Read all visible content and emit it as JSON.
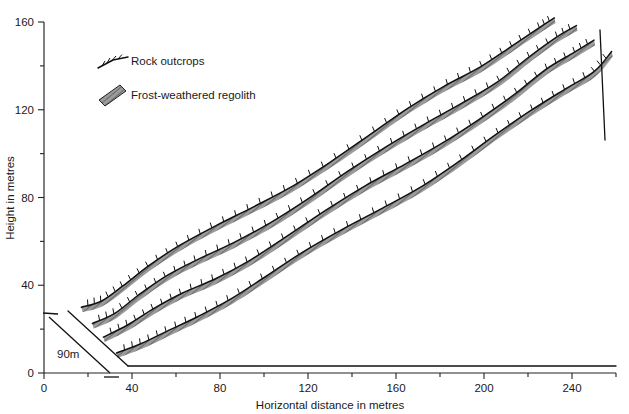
{
  "figure": {
    "type": "block-diagram"
  },
  "axes": {
    "x": {
      "title": "Horizontal distance in metres",
      "min": 0,
      "max": 260,
      "major_step": 40,
      "minor_step": 20,
      "labels": [
        "0",
        "40",
        "80",
        "120",
        "160",
        "200",
        "240"
      ],
      "label_values": [
        0,
        40,
        80,
        120,
        160,
        200,
        240
      ],
      "minor_values": [
        20,
        60,
        100,
        140,
        180,
        220,
        260
      ]
    },
    "y": {
      "title": "Height in metres",
      "min": 0,
      "max": 160,
      "major_step": 40,
      "minor_step": 20,
      "labels": [
        "0",
        "40",
        "80",
        "120",
        "160"
      ],
      "label_values": [
        0,
        40,
        80,
        120,
        160
      ],
      "minor_values": [
        20,
        60,
        100,
        140
      ]
    }
  },
  "legend": {
    "items": [
      {
        "label": "Rock outcrops",
        "symbol": "hachured-line",
        "color": "#111111"
      },
      {
        "label": "Frost-weathered regolith",
        "symbol": "hatched-band",
        "color": "#999999"
      }
    ]
  },
  "scale_bar": {
    "label": "90m",
    "value": 90,
    "unit": "m",
    "orientation": "diagonal-front-left-edge"
  },
  "chart_data": {
    "type": "line",
    "title": "",
    "xlabel": "Horizontal distance in metres",
    "ylabel": "Height in metres",
    "xlim": [
      0,
      260
    ],
    "ylim": [
      0,
      160
    ],
    "grid": false,
    "legend_position": "upper-left",
    "series": [
      {
        "name": "Ridge crest 1 (rearmost)",
        "x": [
          17,
          26,
          36,
          48,
          62,
          78,
          95,
          112,
          130,
          148,
          165,
          182,
          198,
          212,
          225,
          232
        ],
        "y": [
          30,
          34,
          41,
          49,
          57,
          66,
          76,
          86,
          97,
          108,
          119,
          130,
          140,
          150,
          158,
          161
        ]
      },
      {
        "name": "Ridge crest 2",
        "x": [
          22,
          32,
          43,
          56,
          70,
          86,
          103,
          120,
          138,
          156,
          173,
          190,
          206,
          220,
          233,
          242
        ],
        "y": [
          24,
          28,
          35,
          43,
          51,
          60,
          70,
          80,
          91,
          102,
          113,
          124,
          134,
          144,
          152,
          157
        ]
      },
      {
        "name": "Ridge crest 3",
        "x": [
          27,
          38,
          50,
          63,
          78,
          94,
          111,
          128,
          146,
          164,
          181,
          198,
          214,
          228,
          241,
          250
        ],
        "y": [
          17,
          21,
          28,
          36,
          44,
          53,
          63,
          73,
          84,
          95,
          106,
          117,
          127,
          137,
          145,
          152
        ]
      },
      {
        "name": "Ridge crest 4 (frontmost)",
        "x": [
          33,
          44,
          56,
          70,
          85,
          101,
          118,
          135,
          153,
          171,
          188,
          205,
          221,
          236,
          250,
          258
        ],
        "y": [
          8,
          12,
          19,
          27,
          35,
          44,
          54,
          64,
          75,
          86,
          97,
          108,
          118,
          128,
          138,
          148
        ]
      }
    ]
  }
}
